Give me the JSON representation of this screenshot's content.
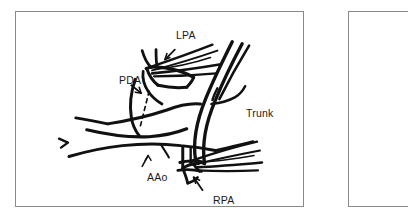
{
  "figure": {
    "type": "line-art-anatomical-illustration",
    "background_color": "#ffffff",
    "ink_color": "#111111",
    "border_color": "#8a8a8a",
    "labels": [
      {
        "id": "lpa",
        "text": "LPA",
        "pointer": "arrow",
        "x": 160,
        "y": 18
      },
      {
        "id": "pda",
        "text": "PDA",
        "pointer": "arrow",
        "x": 103,
        "y": 63
      },
      {
        "id": "trunk",
        "text": "Trunk",
        "pointer": "none",
        "x": 230,
        "y": 96
      },
      {
        "id": "aao",
        "text": "AAo",
        "pointer": "leader",
        "x": 131,
        "y": 160
      },
      {
        "id": "rpa",
        "text": "RPA",
        "pointer": "arrow",
        "x": 197,
        "y": 183
      }
    ],
    "annotations": {
      "pda_line_style": "dashed",
      "instrument_count": 2,
      "instruments": [
        "upper-forceps-on-LPA",
        "lower-forceps-on-RPA"
      ]
    }
  }
}
